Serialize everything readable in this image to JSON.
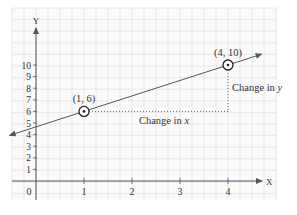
{
  "chart_data": {
    "type": "line",
    "title": "",
    "xlabel": "X",
    "ylabel": "Y",
    "xlim": [
      0,
      4.9
    ],
    "ylim": [
      0,
      12
    ],
    "grid": true,
    "x_ticks": [
      "1",
      "2",
      "3",
      "4"
    ],
    "y_ticks": [
      "1",
      "2",
      "3",
      "4",
      "5",
      "6",
      "7",
      "8",
      "9",
      "10"
    ],
    "origin_label": "0",
    "series": [
      {
        "name": "line",
        "x": [
          1,
          4
        ],
        "y": [
          6,
          10
        ],
        "extends_both_directions": true
      }
    ],
    "points": [
      {
        "x": 1,
        "y": 6,
        "label": "(1, 6)"
      },
      {
        "x": 4,
        "y": 10,
        "label": "(4, 10)"
      }
    ],
    "annotations": [
      {
        "text": "Change in",
        "var": "x",
        "type": "horizontal-run",
        "from": [
          1,
          6
        ],
        "to": [
          4,
          6
        ]
      },
      {
        "text": "Change in",
        "var": "y",
        "type": "vertical-rise",
        "from": [
          4,
          6
        ],
        "to": [
          4,
          10
        ]
      }
    ],
    "colors": {
      "grid": "#e4e4e4",
      "axis": "#555555",
      "line": "#555555",
      "text": "#333333",
      "dotted": "#666666"
    }
  }
}
